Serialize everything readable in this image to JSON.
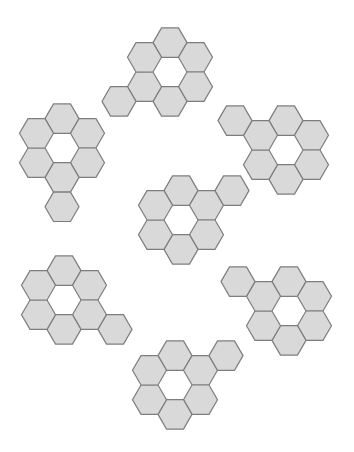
{
  "page": {
    "width": 354,
    "height": 452,
    "background_color": "#ffffff"
  },
  "style": {
    "hex_fill_color": "#d9d9d9",
    "hex_stroke_color": "#7d7d7d",
    "hex_stroke_width": 1.2,
    "hex_width": 34,
    "hex_height": 29.4,
    "hex_side": 17
  },
  "geometry": {
    "note": "Flat-top hexagons. Axial offsets in hex units: column step = 1.5*side horizontally, row step = height vertically, odd columns shifted down by half height.",
    "ring_offsets": [
      {
        "cx": 0.0,
        "cy": -1.0
      },
      {
        "cx": 0.866,
        "cy": -0.5
      },
      {
        "cx": 0.866,
        "cy": 0.5
      },
      {
        "cx": 0.0,
        "cy": 1.0
      },
      {
        "cx": -0.866,
        "cy": 0.5
      },
      {
        "cx": -0.866,
        "cy": -0.5
      }
    ]
  },
  "chart_data": {
    "type": "diagram",
    "figure_count": 7,
    "common_structure": "hexagonal ring of 6 shaded hexagons around an empty center",
    "figures": [
      {
        "id": "figure-1",
        "label": "Top figure",
        "center_x": 170,
        "center_y": 72,
        "ring_hex_count": 6,
        "extra_hex_count": 1,
        "extra_hex_position": "lower-left",
        "extra_offset": {
          "cx": -1.732,
          "cy": 1.0
        },
        "total_hexagons": 7
      },
      {
        "id": "figure-2",
        "label": "Upper-left figure",
        "center_x": 62,
        "center_y": 148,
        "ring_hex_count": 6,
        "extra_hex_count": 1,
        "extra_hex_position": "bottom",
        "extra_offset": {
          "cx": 0.0,
          "cy": 2.0
        },
        "total_hexagons": 7
      },
      {
        "id": "figure-3",
        "label": "Upper-right figure",
        "center_x": 286,
        "center_y": 150,
        "ring_hex_count": 6,
        "extra_hex_count": 1,
        "extra_hex_position": "upper-left",
        "extra_offset": {
          "cx": -1.732,
          "cy": -1.0
        },
        "total_hexagons": 7
      },
      {
        "id": "figure-4",
        "label": "Center figure",
        "center_x": 181,
        "center_y": 220,
        "ring_hex_count": 6,
        "extra_hex_count": 1,
        "extra_hex_position": "upper-right",
        "extra_offset": {
          "cx": 1.732,
          "cy": -1.0
        },
        "total_hexagons": 7
      },
      {
        "id": "figure-5",
        "label": "Lower-left figure",
        "center_x": 64,
        "center_y": 300,
        "ring_hex_count": 6,
        "extra_hex_count": 1,
        "extra_hex_position": "lower-right",
        "extra_offset": {
          "cx": 1.732,
          "cy": 1.0
        },
        "total_hexagons": 7
      },
      {
        "id": "figure-6",
        "label": "Lower-right figure",
        "center_x": 289,
        "center_y": 311,
        "ring_hex_count": 6,
        "extra_hex_count": 1,
        "extra_hex_position": "upper-left",
        "extra_offset": {
          "cx": -1.732,
          "cy": -1.0
        },
        "total_hexagons": 7
      },
      {
        "id": "figure-7",
        "label": "Bottom figure",
        "center_x": 175,
        "center_y": 385,
        "ring_hex_count": 6,
        "extra_hex_count": 1,
        "extra_hex_position": "upper-right",
        "extra_offset": {
          "cx": 1.732,
          "cy": -1.0
        },
        "total_hexagons": 7
      }
    ]
  }
}
